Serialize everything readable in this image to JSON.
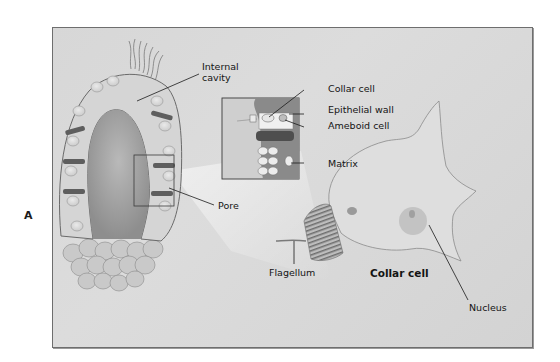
{
  "figure": {
    "panel_letter": "A",
    "labels": {
      "internal_cavity_line1": "Internal",
      "internal_cavity_line2": "cavity",
      "collar_cell_inset": "Collar cell",
      "epithelial_wall": "Epithelial wall",
      "ameboid_cell": "Ameboid cell",
      "matrix": "Matrix",
      "pore": "Pore",
      "flagellum": "Flagellum",
      "collar_cell_title": "Collar cell",
      "nucleus": "Nucleus"
    },
    "colors": {
      "background": "#d8d8d8",
      "frame_border": "#6e6e6e",
      "tissue_dark": "#6a6a6a",
      "tissue_light": "#f2f2f2",
      "cavity": "#a8a8a8",
      "label_text": "#141414"
    }
  }
}
